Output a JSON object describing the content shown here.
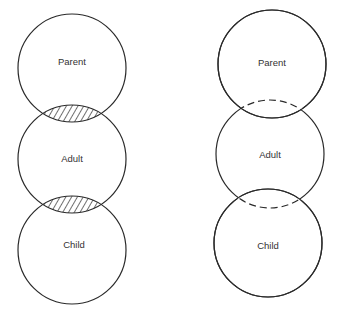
{
  "diagrams": [
    {
      "name": "contaminated-ego-states",
      "circles": [
        {
          "label": "Parent"
        },
        {
          "label": "Adult"
        },
        {
          "label": "Child"
        }
      ],
      "overlaps": [
        "Parent-Adult hatched",
        "Adult-Child hatched"
      ]
    },
    {
      "name": "clear-boundaries-ego-states",
      "circles": [
        {
          "label": "Parent"
        },
        {
          "label": "Adult"
        },
        {
          "label": "Child"
        }
      ],
      "overlaps": [
        "Parent-Adult dashed",
        "Adult-Child dashed"
      ]
    }
  ],
  "colors": {
    "stroke": "#2a2a2a",
    "background": "#ffffff"
  }
}
